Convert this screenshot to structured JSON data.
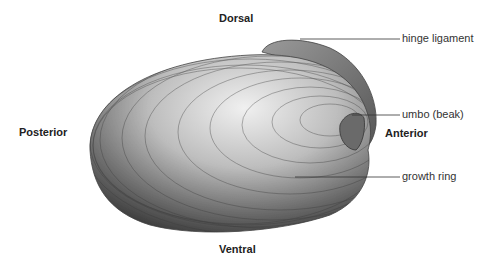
{
  "orientation": {
    "dorsal": "Dorsal",
    "ventral": "Ventral",
    "posterior": "Posterior",
    "anterior": "Anterior"
  },
  "callouts": [
    {
      "label": "hinge ligament"
    },
    {
      "label": "umbo (beak)"
    },
    {
      "label": "growth ring"
    }
  ],
  "colors": {
    "shell_light": "#e6e6e6",
    "shell_dark": "#4a4a4a",
    "line": "#333333"
  }
}
